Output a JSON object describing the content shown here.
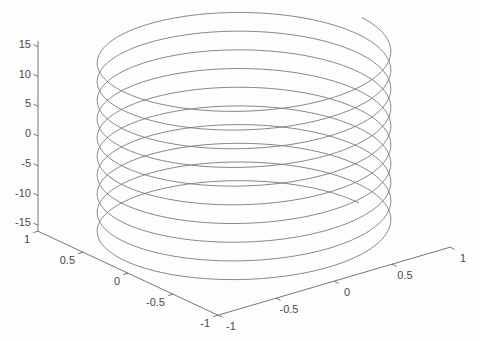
{
  "figure": {
    "background": "#fdfdfd"
  },
  "chart_data": {
    "type": "line",
    "subtype": "3d-parametric-curve",
    "title": "",
    "xlabel": "",
    "ylabel": "",
    "zlabel": "",
    "parametric": {
      "x": "cos(2*t)",
      "y": "sin(2*t)",
      "z": "t",
      "t_min": -15.7,
      "t_max": 15.7,
      "omega": 2,
      "radius": 1,
      "turns": 10,
      "sample_step": 0.015
    },
    "axes": {
      "x": {
        "lim": [
          -1,
          1
        ],
        "ticks": [
          -1,
          -0.5,
          0,
          0.5,
          1
        ],
        "tick_labels": [
          "-1",
          "-0.5",
          "0",
          "0.5",
          "1"
        ]
      },
      "y": {
        "lim": [
          -1,
          1
        ],
        "ticks": [
          -1,
          -0.5,
          0,
          0.5,
          1
        ],
        "tick_labels": [
          "-1",
          "-0.5",
          "0",
          "0.5",
          "1"
        ]
      },
      "z": {
        "lim": [
          -16,
          16
        ],
        "ticks": [
          -15,
          -10,
          -5,
          0,
          5,
          10,
          15
        ],
        "tick_labels": [
          "-15",
          "-10",
          "-5",
          "0",
          "5",
          "10",
          "15"
        ]
      }
    },
    "view": {
      "azimuth": -37.5,
      "elevation": 30,
      "projection": "orthographic"
    },
    "grid": false,
    "box": false,
    "legend": null,
    "style": {
      "line_color": "#787878",
      "axis_color": "#666666",
      "label_color": "#4a4a4a",
      "line_width": 0.9,
      "tick_length": 5,
      "font_size": 11
    },
    "screen_mapping": {
      "origin": [
        244,
        144
      ],
      "vx": [
        116,
        -34
      ],
      "vy": [
        -90,
        -42
      ],
      "vz": [
        0,
        -5.95
      ]
    }
  }
}
